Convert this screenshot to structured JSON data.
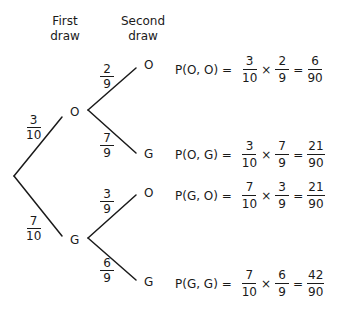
{
  "headers": {
    "first": "First draw",
    "first_l1": "First",
    "first_l2": "draw",
    "second_l1": "Second",
    "second_l2": "draw"
  },
  "first_draw": {
    "O": {
      "label": "O",
      "prob_num": "3",
      "prob_den": "10"
    },
    "G": {
      "label": "G",
      "prob_num": "7",
      "prob_den": "10"
    }
  },
  "second_draw": {
    "OO": {
      "label": "O",
      "prob_num": "2",
      "prob_den": "9"
    },
    "OG": {
      "label": "G",
      "prob_num": "7",
      "prob_den": "9"
    },
    "GO": {
      "label": "O",
      "prob_num": "3",
      "prob_den": "9"
    },
    "GG": {
      "label": "G",
      "prob_num": "6",
      "prob_den": "9"
    }
  },
  "equations": [
    {
      "label": "P(O, O) =",
      "a_num": "3",
      "a_den": "10",
      "b_num": "2",
      "b_den": "9",
      "r_num": "6",
      "r_den": "90"
    },
    {
      "label": "P(O, G) =",
      "a_num": "3",
      "a_den": "10",
      "b_num": "7",
      "b_den": "9",
      "r_num": "21",
      "r_den": "90"
    },
    {
      "label": "P(G, O) =",
      "a_num": "7",
      "a_den": "10",
      "b_num": "3",
      "b_den": "9",
      "r_num": "21",
      "r_den": "90"
    },
    {
      "label": "P(G, G) =",
      "a_num": "7",
      "a_den": "10",
      "b_num": "6",
      "b_den": "9",
      "r_num": "42",
      "r_den": "90"
    }
  ],
  "ops": {
    "times": "×",
    "equals": "="
  }
}
